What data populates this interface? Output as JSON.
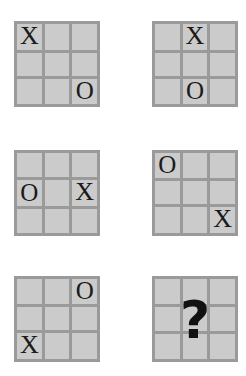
{
  "puzzle": {
    "type": "tic-tac-toe-sequence",
    "background_color": "#ffffff",
    "cell_color": "#cbcbcb",
    "gridline_color": "#9a9a9a",
    "mark_color": "#1a1a1a",
    "unknown_symbol": "?",
    "grids": [
      {
        "name": "grid-1",
        "position": "top-left",
        "cells": [
          [
            "X",
            "",
            ""
          ],
          [
            "",
            "",
            ""
          ],
          [
            "",
            "",
            "O"
          ]
        ]
      },
      {
        "name": "grid-2",
        "position": "top-right",
        "cells": [
          [
            "",
            "X",
            ""
          ],
          [
            "",
            "",
            ""
          ],
          [
            "",
            "O",
            ""
          ]
        ]
      },
      {
        "name": "grid-3",
        "position": "middle-left",
        "cells": [
          [
            "",
            "",
            ""
          ],
          [
            "O",
            "",
            "X"
          ],
          [
            "",
            "",
            ""
          ]
        ]
      },
      {
        "name": "grid-4",
        "position": "middle-right",
        "cells": [
          [
            "O",
            "",
            ""
          ],
          [
            "",
            "",
            ""
          ],
          [
            "",
            "",
            "X"
          ]
        ]
      },
      {
        "name": "grid-5",
        "position": "bottom-left",
        "cells": [
          [
            "",
            "",
            "O"
          ],
          [
            "",
            "",
            ""
          ],
          [
            "X",
            "",
            ""
          ]
        ]
      },
      {
        "name": "grid-6",
        "position": "bottom-right",
        "cells": [
          [
            "",
            "",
            ""
          ],
          [
            "",
            "",
            ""
          ],
          [
            "",
            "",
            ""
          ]
        ],
        "overlay": "?"
      }
    ]
  }
}
